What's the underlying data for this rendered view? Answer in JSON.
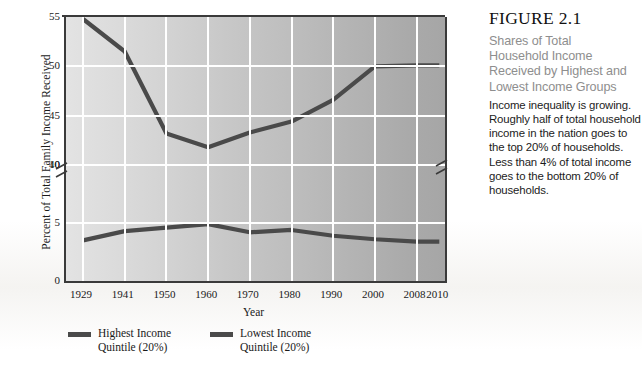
{
  "figure": {
    "number": "FIGURE 2.1",
    "subtitle": "Shares of Total\nHousehold Income\nReceived by Highest and\nLowest Income Groups",
    "description": "Income inequality is growing. Roughly half of total household income in the nation goes to the top 20% of households. Less than 4% of total income goes to the bottom 20% of households."
  },
  "chart_data": {
    "type": "line",
    "title": "Shares of Total Household Income Received by Highest and Lowest Income Groups",
    "xlabel": "Year",
    "ylabel": "Percent of Total Family Income Received",
    "categories": [
      "1929",
      "1941",
      "1950",
      "1960",
      "1970",
      "1980",
      "1990",
      "2000",
      "2008",
      "2010"
    ],
    "ytick_labels": [
      "55",
      "50",
      "45",
      "40",
      "10",
      "5",
      "0"
    ],
    "ytick_values": [
      55,
      50,
      45,
      40,
      10,
      5,
      0
    ],
    "yaxis_broken": true,
    "yaxis_break_between": [
      40,
      10
    ],
    "ylim": [
      0,
      55
    ],
    "grid": true,
    "legend_position": "below-left",
    "series": [
      {
        "name": "Highest Income\nQuintile (20%)",
        "color": "#4a4a4a",
        "values": [
          54.8,
          51.5,
          43.2,
          41.8,
          43.3,
          44.4,
          46.6,
          50.0,
          50.1,
          50.1
        ]
      },
      {
        "name": "Lowest Income\nQuintile (20%)",
        "color": "#4a4a4a",
        "values": [
          3.5,
          4.3,
          4.6,
          4.9,
          4.2,
          4.4,
          3.9,
          3.6,
          3.4,
          3.4
        ]
      }
    ]
  },
  "axis": {
    "x_title": "Year",
    "y_title": "Percent of Total Family Income Received"
  },
  "legend": {
    "items": [
      {
        "label": "Highest Income\nQuintile (20%)"
      },
      {
        "label": "Lowest Income\nQuintile (20%)"
      }
    ]
  }
}
